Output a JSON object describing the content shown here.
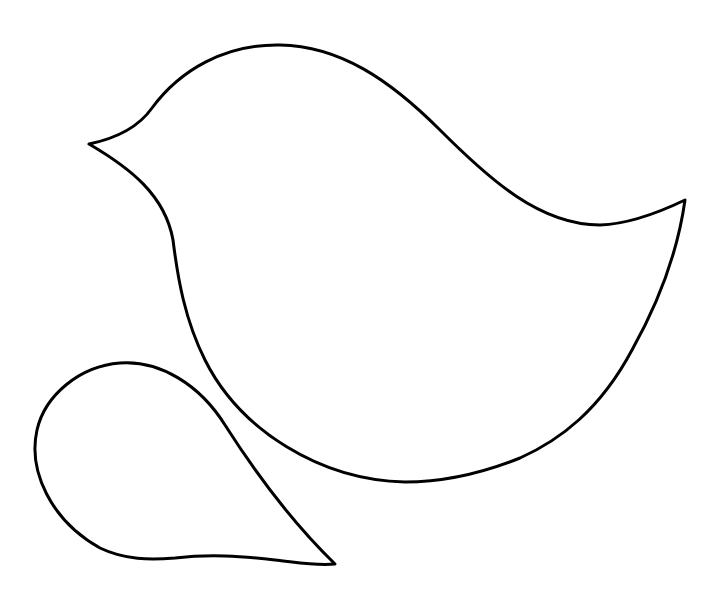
{
  "figure": {
    "title": "Bird template outline",
    "background_color": "#ffffff",
    "stroke_color": "#000000",
    "stroke_width": 3,
    "shapes": [
      {
        "name": "bird-body",
        "label": "Bird body outline",
        "path": "M 89 144 C 118 138, 140 125, 152 108 C 180 70, 225 44, 280 45 C 340 46, 390 80, 440 130 C 490 180, 540 225, 600 225 C 630 224, 660 212, 685 200 C 678 250, 660 300, 632 350 C 600 410, 560 440, 520 458 C 480 474, 440 482, 405 482 C 320 480, 240 430, 205 360 C 185 320, 178 280, 173 240 C 165 195, 130 168, 89 144 Z"
      },
      {
        "name": "bird-wing",
        "label": "Wing outline",
        "path": "M 335 564 C 300 530, 260 480, 225 425 C 200 385, 160 360, 120 363 C 80 366, 45 395, 37 430 C 28 470, 50 520, 100 548 C 125 560, 150 560, 175 558 C 210 554, 240 556, 275 560 C 295 562, 315 566, 335 564 Z"
      }
    ]
  }
}
